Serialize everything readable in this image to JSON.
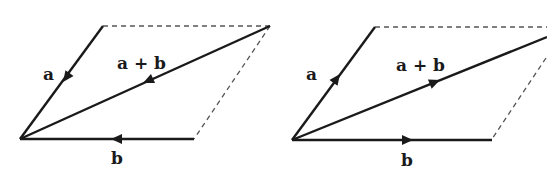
{
  "colors": {
    "vector": "#1a1a1a",
    "dashed": "#555555",
    "background": "#ffffff"
  },
  "diagrams": [
    {
      "id": "left",
      "direction": "toward-origin",
      "labels": {
        "a": "a",
        "sum": "a + b",
        "b": "b"
      }
    },
    {
      "id": "right",
      "direction": "away-from-origin",
      "labels": {
        "a": "a",
        "sum": "a + b",
        "b": "b"
      }
    }
  ]
}
